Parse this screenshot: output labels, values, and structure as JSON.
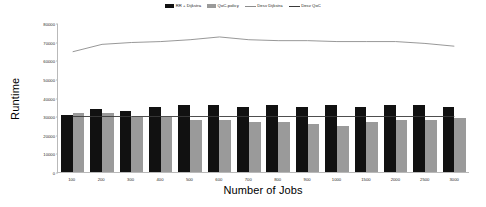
{
  "chart_data": {
    "type": "bar",
    "title": "",
    "xlabel": "Number of Jobs",
    "ylabel": "Runtime",
    "categories": [
      "100",
      "200",
      "300",
      "400",
      "500",
      "600",
      "700",
      "800",
      "900",
      "1000",
      "1500",
      "2000",
      "2500",
      "3000"
    ],
    "ylim": [
      0,
      80000
    ],
    "yticks": [
      0,
      10000,
      20000,
      30000,
      40000,
      50000,
      60000,
      70000,
      80000
    ],
    "grid": false,
    "legend_position": "top-center",
    "series": [
      {
        "name": "RR + Dijkstra",
        "type": "bar",
        "color": "#111111",
        "values": [
          31000,
          34000,
          33000,
          35000,
          36000,
          36000,
          35000,
          36000,
          35000,
          36000,
          35000,
          36000,
          36000,
          35000
        ]
      },
      {
        "name": "QoC-policy",
        "type": "bar",
        "color": "#9a9a9a",
        "values": [
          32000,
          32000,
          30000,
          30000,
          28000,
          28000,
          27000,
          27000,
          26000,
          25000,
          27000,
          28000,
          28000,
          29000
        ]
      },
      {
        "name": "Desv Dijkstra",
        "type": "line",
        "color": "#8c8c8c",
        "values": [
          65000,
          69000,
          70000,
          70500,
          71500,
          73000,
          71500,
          71000,
          71000,
          70500,
          70500,
          70500,
          69500,
          68000
        ]
      },
      {
        "name": "Desv QoC",
        "type": "line",
        "color": "#3a3a3a",
        "values": [
          30000,
          30000,
          30000,
          30000,
          30000,
          30000,
          30000,
          30000,
          30000,
          30000,
          30000,
          30000,
          30000,
          30000
        ]
      }
    ]
  },
  "legend": {
    "items": [
      {
        "label": "RR + Dijkstra",
        "marker": "bar-swatch",
        "color": "#111111"
      },
      {
        "label": "QoC-policy",
        "marker": "bar-swatch",
        "color": "#9a9a9a"
      },
      {
        "label": "Desv Dijkstra",
        "marker": "line-swatch",
        "color": "#8c8c8c"
      },
      {
        "label": "Desv QoC",
        "marker": "line-swatch",
        "color": "#3a3a3a"
      }
    ]
  },
  "axes": {
    "y_title": "Runtime",
    "x_title": "Number of Jobs"
  }
}
